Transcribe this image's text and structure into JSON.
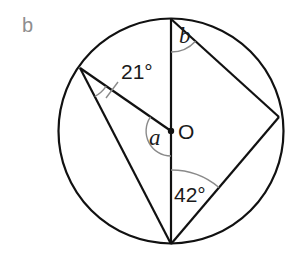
{
  "panel": {
    "label": "b"
  },
  "diagram": {
    "center_label": "O",
    "angles": {
      "given_left": "21°",
      "given_bottom": "42°",
      "unknown_center": "a",
      "unknown_top": "b"
    },
    "colors": {
      "lines": "#111111",
      "arcs": "#8a8a8a",
      "panel_label": "#8e8e8e"
    }
  }
}
